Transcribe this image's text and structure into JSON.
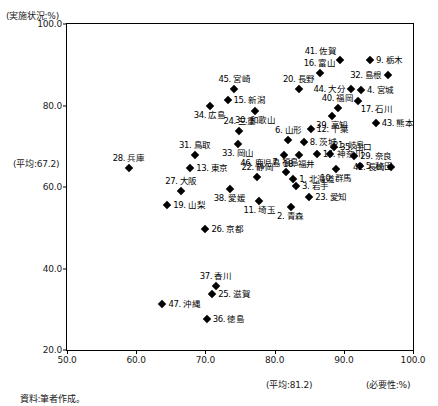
{
  "axes": {
    "y_axis_title": "(実施状況:%)",
    "x_axis_title": "(必要性:%)",
    "y_mean_label": "(平均:67.2)",
    "x_mean_label": "(平均:81.2)",
    "y_ticks": [
      "100.0",
      "80.0",
      "60.0",
      "40.0",
      "20.0"
    ],
    "x_ticks": [
      "50.0",
      "60.0",
      "70.0",
      "80.0",
      "90.0",
      "100.0"
    ],
    "y_min": 20.0,
    "y_max": 100.0,
    "x_min": 50.0,
    "x_max": 100.0,
    "y_mean": 67.2,
    "x_mean": 81.2
  },
  "source_note": "資料:筆者作成。",
  "chart_data": {
    "type": "scatter",
    "title": "",
    "xlabel": "(必要性:%)",
    "ylabel": "(実施状況:%)",
    "xlim": [
      50.0,
      100.0
    ],
    "ylim": [
      20.0,
      100.0
    ],
    "grid": false,
    "legend": "none",
    "annotations": [
      "(平均:67.2)",
      "(平均:81.2)"
    ],
    "points": [
      {
        "label": "41. 佐賀",
        "x": 89.4,
        "y": 91.2,
        "pos": "lbl-ul"
      },
      {
        "label": "9. 栃木",
        "x": 93.8,
        "y": 91.2,
        "pos": "lbl-right"
      },
      {
        "label": "32. 島根",
        "x": 96.4,
        "y": 87.6,
        "pos": "lbl-left"
      },
      {
        "label": "16. 富山",
        "x": 86.5,
        "y": 88.0,
        "pos": "lbl-above"
      },
      {
        "label": "4. 宮城",
        "x": 92.5,
        "y": 83.7,
        "pos": "lbl-right"
      },
      {
        "label": "45. 宮崎",
        "x": 74.2,
        "y": 84.1,
        "pos": "lbl-above"
      },
      {
        "label": "20. 長野",
        "x": 83.5,
        "y": 84.1,
        "pos": "lbl-above"
      },
      {
        "label": "44. 大分",
        "x": 91.1,
        "y": 84.1,
        "pos": "lbl-left"
      },
      {
        "label": "15. 新潟",
        "x": 73.2,
        "y": 81.3,
        "pos": "lbl-right"
      },
      {
        "label": "17. 石川",
        "x": 92.0,
        "y": 81.0,
        "pos": "lbl-br"
      },
      {
        "label": "40. 福岡",
        "x": 89.1,
        "y": 79.5,
        "pos": "lbl-above"
      },
      {
        "label": "34. 広島",
        "x": 70.6,
        "y": 79.8,
        "pos": "lbl-below"
      },
      {
        "label": "30. 和歌山",
        "x": 77.2,
        "y": 78.7,
        "pos": "lbl-below"
      },
      {
        "label": "39. 高知",
        "x": 88.3,
        "y": 77.4,
        "pos": "lbl-below"
      },
      {
        "label": "43. 熊本",
        "x": 94.6,
        "y": 75.6,
        "pos": "lbl-right"
      },
      {
        "label": "24. 三重",
        "x": 74.9,
        "y": 73.8,
        "pos": "lbl-above"
      },
      {
        "label": "12. 千葉",
        "x": 85.2,
        "y": 74.3,
        "pos": "lbl-right"
      },
      {
        "label": "6. 山形",
        "x": 82.0,
        "y": 71.5,
        "pos": "lbl-above"
      },
      {
        "label": "8. 茨城",
        "x": 84.2,
        "y": 71.0,
        "pos": "lbl-right"
      },
      {
        "label": "33. 岡山",
        "x": 74.7,
        "y": 70.5,
        "pos": "lbl-below"
      },
      {
        "label": "35. 山口",
        "x": 88.6,
        "y": 69.7,
        "pos": "lbl-right"
      },
      {
        "label": "31. 鳥取",
        "x": 68.5,
        "y": 67.9,
        "pos": "lbl-above"
      },
      {
        "label": "21. 岐阜",
        "x": 88.0,
        "y": 68.2,
        "pos": "lbl-ur"
      },
      {
        "label": "14. 神奈川",
        "x": 86.1,
        "y": 68.0,
        "pos": "lbl-right"
      },
      {
        "label": "29. 奈良",
        "x": 91.5,
        "y": 67.6,
        "pos": "lbl-right"
      },
      {
        "label": "28. 兵庫",
        "x": 58.9,
        "y": 64.7,
        "pos": "lbl-above"
      },
      {
        "label": "13. 東京",
        "x": 67.8,
        "y": 64.7,
        "pos": "lbl-right"
      },
      {
        "label": "46. 鹿児島",
        "x": 81.3,
        "y": 67.9,
        "pos": "lbl-bl"
      },
      {
        "label": "18. 福井",
        "x": 83.5,
        "y": 67.9,
        "pos": "lbl-below"
      },
      {
        "label": "5. 秋田",
        "x": 92.3,
        "y": 65.2,
        "pos": "lbl-right"
      },
      {
        "label": "10. 群馬",
        "x": 88.9,
        "y": 64.4,
        "pos": "lbl-below"
      },
      {
        "label": "42. 長崎",
        "x": 96.8,
        "y": 65.0,
        "pos": "lbl-left"
      },
      {
        "label": "7. 福島",
        "x": 81.6,
        "y": 63.6,
        "pos": "lbl-above"
      },
      {
        "label": "1. 北海道",
        "x": 82.7,
        "y": 62.0,
        "pos": "lbl-right"
      },
      {
        "label": "22. 静岡",
        "x": 77.5,
        "y": 62.4,
        "pos": "lbl-above"
      },
      {
        "label": "3. 岩手",
        "x": 83.1,
        "y": 60.3,
        "pos": "lbl-right"
      },
      {
        "label": "27. 大阪",
        "x": 66.5,
        "y": 58.9,
        "pos": "lbl-above"
      },
      {
        "label": "38. 愛媛",
        "x": 73.5,
        "y": 59.4,
        "pos": "lbl-below"
      },
      {
        "label": "23. 愛知",
        "x": 85.0,
        "y": 57.6,
        "pos": "lbl-right"
      },
      {
        "label": "19. 山梨",
        "x": 64.5,
        "y": 55.5,
        "pos": "lbl-right"
      },
      {
        "label": "11. 埼玉",
        "x": 77.8,
        "y": 56.5,
        "pos": "lbl-below"
      },
      {
        "label": "2. 青森",
        "x": 82.3,
        "y": 55.0,
        "pos": "lbl-below"
      },
      {
        "label": "26. 京都",
        "x": 70.0,
        "y": 49.8,
        "pos": "lbl-right"
      },
      {
        "label": "37. 香川",
        "x": 71.5,
        "y": 35.6,
        "pos": "lbl-above"
      },
      {
        "label": "25. 滋賀",
        "x": 71.0,
        "y": 33.8,
        "pos": "lbl-right"
      },
      {
        "label": "47. 沖縄",
        "x": 63.8,
        "y": 31.2,
        "pos": "lbl-right"
      },
      {
        "label": "36. 徳島",
        "x": 70.2,
        "y": 27.5,
        "pos": "lbl-right"
      }
    ]
  }
}
